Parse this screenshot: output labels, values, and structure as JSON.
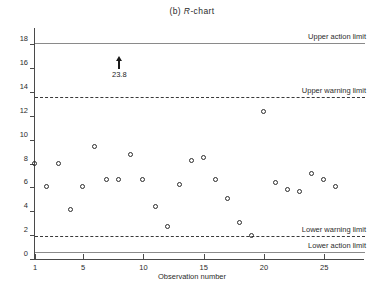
{
  "chart_data": {
    "type": "scatter",
    "title": "(b) R-chart",
    "title_prefix": "(b) ",
    "title_italic": "R",
    "title_suffix": "-chart",
    "xlabel": "Observation number",
    "ylabel": "Sample range",
    "xlim": [
      0,
      28
    ],
    "ylim": [
      0,
      19.2
    ],
    "grid": false,
    "legend": "none",
    "yticks": [
      0,
      2,
      4,
      6,
      8,
      10,
      12,
      14,
      16,
      18
    ],
    "ytick_labels": [
      "0",
      "2",
      "4",
      "6",
      "8",
      "10",
      "12",
      "14",
      "16",
      "18"
    ],
    "xticks": [
      1,
      5,
      10,
      15,
      20,
      25
    ],
    "xtick_labels": [
      "1",
      "5",
      "10",
      "15",
      "20",
      "25"
    ],
    "x": [
      1,
      2,
      3,
      4,
      5,
      6,
      7,
      8,
      9,
      10,
      11,
      12,
      13,
      14,
      15,
      16,
      17,
      18,
      19,
      20,
      21,
      22,
      23,
      24,
      25,
      26
    ],
    "values": [
      8.0,
      6.0,
      8.0,
      4.1,
      6.0,
      9.4,
      6.6,
      6.6,
      8.7,
      6.6,
      4.4,
      2.7,
      6.2,
      8.2,
      8.5,
      6.6,
      5.0,
      3.0,
      1.9,
      12.3,
      6.4,
      5.8,
      5.6,
      7.1,
      6.6,
      6.0
    ],
    "out_of_control": {
      "x": 8,
      "label": "23.8",
      "marker": "up-arrow",
      "note": "point above plot range"
    },
    "control_limits": [
      {
        "name": "Upper action limit",
        "value": 18.1,
        "style": "solid",
        "label": "Upper action limit"
      },
      {
        "name": "Upper warning limit",
        "value": 13.6,
        "style": "dashed",
        "label": "Upper warning limit"
      },
      {
        "name": "Lower warning limit",
        "value": 1.9,
        "style": "dashed",
        "label": "Lower warning limit"
      },
      {
        "name": "Lower action limit",
        "value": 0.6,
        "style": "solid",
        "label": "Lower action limit"
      }
    ],
    "colors": {
      "axis": "#4a4a4a",
      "marker": "#2b2b2b",
      "solid_limit": "#8a8a8a",
      "dashed_limit": "#3a3a3a",
      "text": "#2b2b2b"
    }
  }
}
